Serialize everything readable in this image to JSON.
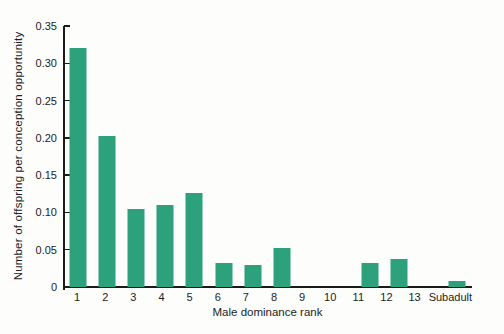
{
  "chart_data": {
    "type": "bar",
    "title": "",
    "xlabel": "Male dominance rank",
    "ylabel": "Number of offspring per conception opportunity",
    "categories": [
      "1",
      "2",
      "3",
      "4",
      "5",
      "6",
      "7",
      "8",
      "9",
      "10",
      "11",
      "12",
      "13",
      "Subadult"
    ],
    "values": [
      0.321,
      0.202,
      0.104,
      0.11,
      0.126,
      0.032,
      0.03,
      0.052,
      0,
      0,
      0.032,
      0.038,
      0,
      0.008
    ],
    "ylim": [
      0,
      0.35
    ],
    "yticks": [
      0,
      0.05,
      0.1,
      0.15,
      0.2,
      0.25,
      0.3,
      0.35
    ],
    "ytick_labels": [
      "0",
      "0.05",
      "0.10",
      "0.15",
      "0.20",
      "0.25",
      "0.30",
      "0.35"
    ],
    "grid": false,
    "legend": false,
    "bar_color": "#2da07c",
    "axis_color": "#1b1b1b",
    "text_color": "#1c1c1c",
    "background_color": "#fdfdfc"
  }
}
